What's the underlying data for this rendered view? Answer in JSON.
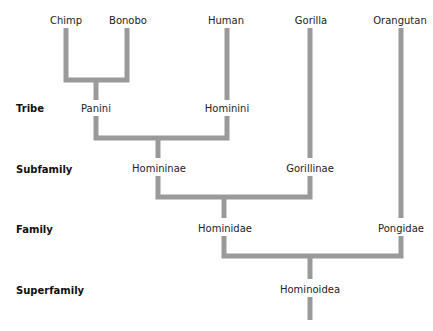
{
  "ranks": {
    "tribe": "Tribe",
    "subfamily": "Subfamily",
    "family": "Family",
    "superfamily": "Superfamily"
  },
  "species": {
    "chimp": "Chimp",
    "bonobo": "Bonobo",
    "human": "Human",
    "gorilla": "Gorilla",
    "orangutan": "Orangutan"
  },
  "taxa": {
    "panini": "Panini",
    "hominini": "Hominini",
    "homininae": "Homininae",
    "gorillinae": "Gorillinae",
    "hominidae": "Hominidae",
    "pongidae": "Pongidae",
    "hominoidea": "Hominoidea"
  },
  "colors": {
    "branch": "#9a9a9a",
    "text": "#222222"
  }
}
